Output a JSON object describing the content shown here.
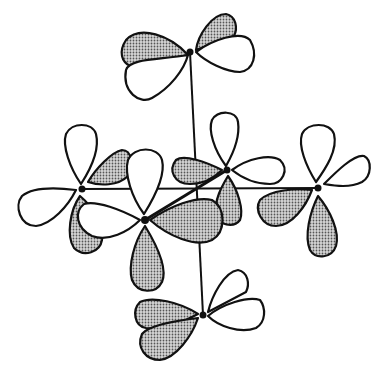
{
  "figure": {
    "type": "orbital-overlap-diagram",
    "colors": {
      "line": "#111111",
      "open_lobe": "#ffffff",
      "shaded_lobe": "#9a9a9a",
      "background": "#ffffff"
    },
    "atoms": [
      {
        "id": "top",
        "x": 190,
        "y": 52
      },
      {
        "id": "left",
        "x": 82,
        "y": 189
      },
      {
        "id": "front",
        "x": 145,
        "y": 220
      },
      {
        "id": "back-right",
        "x": 227,
        "y": 170
      },
      {
        "id": "right",
        "x": 318,
        "y": 188
      },
      {
        "id": "bottom",
        "x": 203,
        "y": 315
      }
    ],
    "bonds": [
      {
        "from": "top",
        "to": "bottom"
      },
      {
        "from": "left",
        "to": "right"
      },
      {
        "from": "front",
        "to": "back-right"
      }
    ]
  }
}
